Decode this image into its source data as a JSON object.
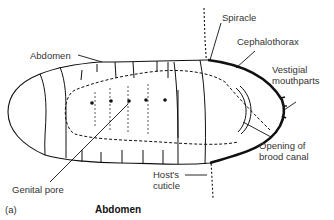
{
  "figure": {
    "panel_label": "(a)",
    "caption": "Abdomen",
    "labels": {
      "abdomen": "Abdomen",
      "spiracle": "Spiracle",
      "cephalothorax": "Cephalothorax",
      "vestigial_line1": "Vestigial",
      "vestigial_line2": "mouthparts",
      "opening_line1": "Opening of",
      "opening_line2": "brood canal",
      "host_line1": "Host's",
      "host_line2": "cuticle",
      "genital_pore": "Genital pore"
    },
    "colors": {
      "ink": "#111111",
      "text": "#333333",
      "background": "#ffffff"
    }
  }
}
